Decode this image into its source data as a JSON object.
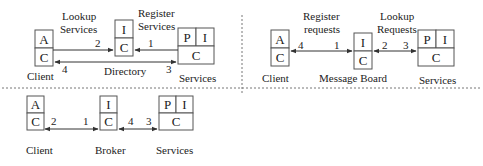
{
  "panels": {
    "directory": {
      "client": {
        "top": "A",
        "bottom": "C",
        "label": "Client"
      },
      "middle": {
        "top": "I",
        "bottom": "C",
        "label": "Directory"
      },
      "services": {
        "top_left": "P",
        "top_right": "I",
        "bottom": "C",
        "label": "Services"
      },
      "edge_labels": {
        "lookup_line1": "Lookup",
        "lookup_line2": "Services",
        "register_line1": "Register",
        "register_line2": "Services"
      },
      "steps": {
        "s1": "1",
        "s2": "2",
        "s3": "3",
        "s4": "4"
      }
    },
    "message_board": {
      "client": {
        "top": "A",
        "bottom": "C",
        "label": "Client"
      },
      "middle": {
        "top": "I",
        "bottom": "C",
        "label": "Message Board"
      },
      "services": {
        "top_left": "P",
        "top_right": "I",
        "bottom": "C",
        "label": "Services"
      },
      "edge_labels": {
        "register_line1": "Register",
        "register_line2": "requests",
        "lookup_line1": "Lookup",
        "lookup_line2": "Requests"
      },
      "steps": {
        "s1": "1",
        "s2": "2",
        "s3": "3",
        "s4": "4"
      }
    },
    "broker": {
      "client": {
        "top": "A",
        "bottom": "C",
        "label": "Client"
      },
      "middle": {
        "top": "I",
        "bottom": "C",
        "label": "Broker"
      },
      "services": {
        "top_left": "P",
        "top_right": "I",
        "bottom": "C",
        "label": "Services"
      },
      "steps": {
        "s1": "1",
        "s2": "2",
        "s3": "3",
        "s4": "4"
      }
    }
  }
}
